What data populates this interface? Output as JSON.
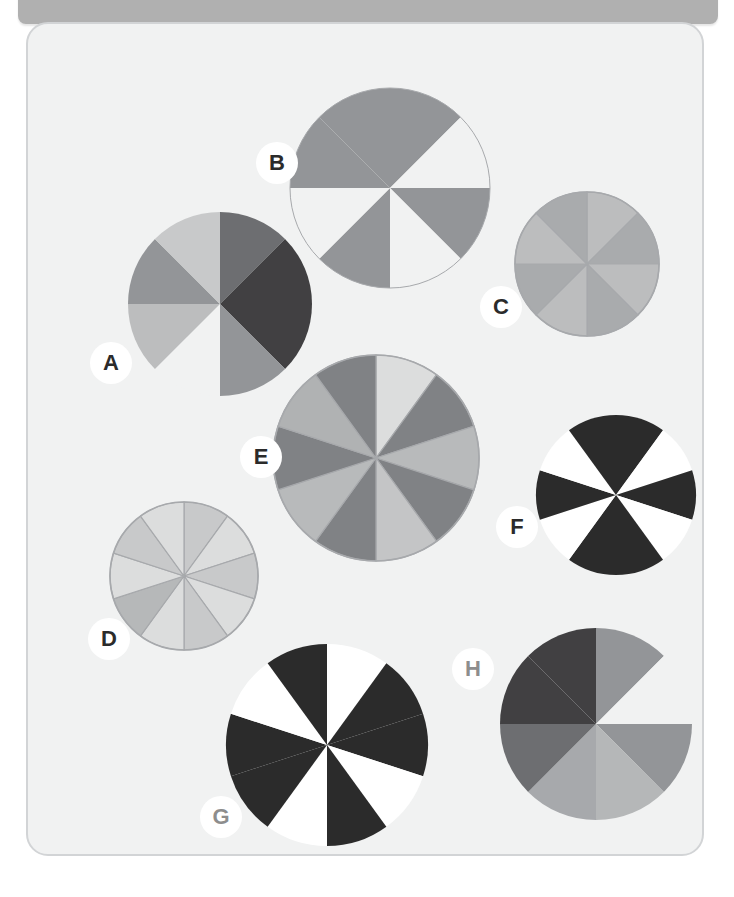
{
  "header": {
    "title": "Reading Pie Charts",
    "bar_color": "#b0b0b0"
  },
  "worksheet": {
    "background": "#f1f2f2",
    "border_color": "#d2d4d6"
  },
  "palette": {
    "white": "#ffffff",
    "black": "#2b2b2b",
    "page": "#f1f2f2",
    "very_light": "#dcdddd",
    "light": "#c8c9ca",
    "light2": "#bcbdbe",
    "mid_light": "#adaeb0",
    "mid": "#939598",
    "mid_dark": "#808285",
    "dark": "#58595b",
    "darker": "#414042",
    "outline": "#a7a9ac"
  },
  "chart_data": [
    {
      "id": "A",
      "type": "pie",
      "title": "A",
      "slices": 8,
      "slice_angle": 45,
      "radius": 92,
      "cx": 192,
      "cy": 280,
      "rotation": -90,
      "outline": false,
      "values": [
        12.5,
        12.5,
        12.5,
        12.5,
        12.5,
        12.5,
        12.5,
        12.5
      ],
      "colors": [
        "#6d6e71",
        "#414042",
        "#414042",
        "#939598",
        "#f1f2f2",
        "#bcbdbe",
        "#939598",
        "#c8c9ca"
      ],
      "shaded_count": 7,
      "label_position": {
        "x": 62,
        "y": 318
      }
    },
    {
      "id": "B",
      "type": "pie",
      "title": "B",
      "slices": 8,
      "slice_angle": 45,
      "radius": 100,
      "cx": 362,
      "cy": 164,
      "rotation": -90,
      "outline": true,
      "values": [
        12.5,
        12.5,
        12.5,
        12.5,
        12.5,
        12.5,
        12.5,
        12.5
      ],
      "colors": [
        "#939598",
        "#f1f2f2",
        "#939598",
        "#f1f2f2",
        "#939598",
        "#f1f2f2",
        "#939598",
        "#939598"
      ],
      "shaded_count": 4,
      "label_position": {
        "x": 228,
        "y": 118
      }
    },
    {
      "id": "C",
      "type": "pie",
      "title": "C",
      "slices": 8,
      "slice_angle": 45,
      "radius": 72,
      "cx": 559,
      "cy": 240,
      "rotation": -90,
      "outline": true,
      "values": [
        12.5,
        12.5,
        12.5,
        12.5,
        12.5,
        12.5,
        12.5,
        12.5
      ],
      "colors": [
        "#bcbdbe",
        "#a9abad",
        "#bcbdbe",
        "#a9abad",
        "#bcbdbe",
        "#a9abad",
        "#bcbdbe",
        "#a9abad"
      ],
      "shaded_count": 4,
      "label_position": {
        "x": 452,
        "y": 262
      }
    },
    {
      "id": "D",
      "type": "pie",
      "title": "D",
      "slices": 10,
      "slice_angle": 36,
      "radius": 74,
      "cx": 156,
      "cy": 552,
      "rotation": -90,
      "outline": true,
      "values": [
        10,
        10,
        10,
        10,
        10,
        10,
        10,
        10,
        10,
        10
      ],
      "colors": [
        "#c8c9ca",
        "#dcdddd",
        "#c8c9ca",
        "#dcdddd",
        "#c8c9ca",
        "#dcdddd",
        "#b6b8b9",
        "#dcdddd",
        "#c8c9ca",
        "#dcdddd"
      ],
      "shaded_count": 5,
      "label_position": {
        "x": 60,
        "y": 594
      }
    },
    {
      "id": "E",
      "type": "pie",
      "title": "E",
      "slices": 10,
      "slice_angle": 36,
      "radius": 103,
      "cx": 348,
      "cy": 434,
      "rotation": -90,
      "outline": true,
      "values": [
        10,
        10,
        10,
        10,
        10,
        10,
        10,
        10,
        10,
        10
      ],
      "colors": [
        "#dcdddd",
        "#808285",
        "#b8babb",
        "#808285",
        "#c4c5c6",
        "#808285",
        "#b8babb",
        "#808285",
        "#b0b2b3",
        "#808285"
      ],
      "shaded_count": 5,
      "label_position": {
        "x": 212,
        "y": 412
      }
    },
    {
      "id": "F",
      "type": "pie",
      "title": "F",
      "slices": 10,
      "slice_angle": 36,
      "radius": 80,
      "cx": 588,
      "cy": 471,
      "rotation": -90,
      "outline": false,
      "values": [
        10,
        10,
        10,
        10,
        10,
        10,
        10,
        10,
        10,
        10
      ],
      "colors": [
        "#2b2b2b",
        "#ffffff",
        "#2b2b2b",
        "#ffffff",
        "#2b2b2b",
        "#2b2b2b",
        "#ffffff",
        "#2b2b2b",
        "#ffffff",
        "#2b2b2b"
      ],
      "shaded_count": 6,
      "label_position": {
        "x": 468,
        "y": 482
      }
    },
    {
      "id": "G",
      "type": "pie",
      "title": "G",
      "slices": 10,
      "slice_angle": 36,
      "radius": 101,
      "cx": 299,
      "cy": 721,
      "rotation": -90,
      "outline": false,
      "values": [
        10,
        10,
        10,
        10,
        10,
        10,
        10,
        10,
        10,
        10
      ],
      "colors": [
        "#ffffff",
        "#2b2b2b",
        "#2b2b2b",
        "#ffffff",
        "#2b2b2b",
        "#ffffff",
        "#2b2b2b",
        "#2b2b2b",
        "#ffffff",
        "#2b2b2b"
      ],
      "shaded_count": 6,
      "label_position": {
        "x": 172,
        "y": 772
      }
    },
    {
      "id": "H",
      "type": "pie",
      "title": "H",
      "slices": 8,
      "slice_angle": 45,
      "radius": 96,
      "cx": 568,
      "cy": 700,
      "rotation": -90,
      "outline": false,
      "values": [
        12.5,
        12.5,
        12.5,
        12.5,
        12.5,
        12.5,
        12.5,
        12.5
      ],
      "colors": [
        "#939598",
        "#f1f2f2",
        "#939598",
        "#b5b7b8",
        "#a7a9ac",
        "#6d6e71",
        "#414042",
        "#414042"
      ],
      "shaded_count": 7,
      "label_position": {
        "x": 424,
        "y": 624
      }
    }
  ],
  "labels": {
    "A": "A",
    "B": "B",
    "C": "C",
    "D": "D",
    "E": "E",
    "F": "F",
    "G": "G",
    "H": "H"
  },
  "label_styles": {
    "A": "dark",
    "B": "dark",
    "C": "dark",
    "D": "dark",
    "E": "dark",
    "F": "dark",
    "G": "mid",
    "H": "mid"
  }
}
